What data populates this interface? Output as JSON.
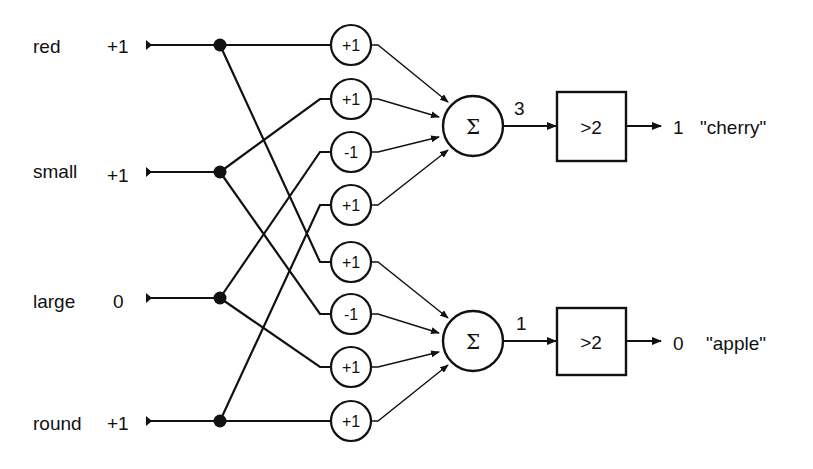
{
  "inputs": [
    {
      "name": "red",
      "value": "+1"
    },
    {
      "name": "small",
      "value": "+1"
    },
    {
      "name": "large",
      "value": "0"
    },
    {
      "name": "round",
      "value": "+1"
    }
  ],
  "weights": [
    "+1",
    "+1",
    "-1",
    "+1",
    "+1",
    "-1",
    "+1",
    "+1"
  ],
  "summers": [
    {
      "symbol": "Σ",
      "sum": "3"
    },
    {
      "symbol": "Σ",
      "sum": "1"
    }
  ],
  "thresholds": [
    {
      "label": ">2",
      "output": "1",
      "class_label": "\"cherry\""
    },
    {
      "label": ">2",
      "output": "0",
      "class_label": "\"apple\""
    }
  ]
}
